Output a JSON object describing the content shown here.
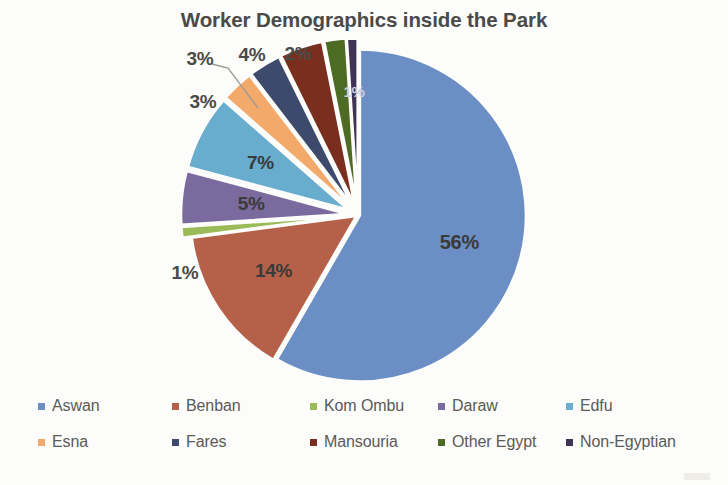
{
  "chart_data": {
    "type": "pie",
    "title": "Worker Demographics inside the Park",
    "xlabel": "",
    "ylabel": "",
    "legend_position": "bottom",
    "grid": false,
    "value_suffix": "%",
    "categories": [
      "Aswan",
      "Benban",
      "Kom Ombu",
      "Daraw",
      "Edfu",
      "Esna",
      "Fares",
      "Mansouria",
      "Other Egypt",
      "Non-Egyptian"
    ],
    "values": [
      56,
      14,
      1,
      5,
      7,
      3,
      3,
      4,
      2,
      1
    ],
    "labels": [
      "56%",
      "14%",
      "1%",
      "5%",
      "7%",
      "3%",
      "3%",
      "4%",
      "2%",
      "1%"
    ],
    "colors": [
      "#6b8fc4",
      "#b5614a",
      "#9bbb59",
      "#7a6a9e",
      "#68acce",
      "#f3a96a",
      "#3d4a6b",
      "#7a2f1e",
      "#4e6b23",
      "#413355"
    ],
    "slices": [
      {
        "name": "Aswan",
        "value": 56,
        "label": "56%",
        "color": "#6b8fc4"
      },
      {
        "name": "Benban",
        "value": 14,
        "label": "14%",
        "color": "#b5614a"
      },
      {
        "name": "Kom Ombu",
        "value": 1,
        "label": "1%",
        "color": "#9bbb59"
      },
      {
        "name": "Daraw",
        "value": 5,
        "label": "5%",
        "color": "#7a6a9e"
      },
      {
        "name": "Edfu",
        "value": 7,
        "label": "7%",
        "color": "#68acce"
      },
      {
        "name": "Esna",
        "value": 3,
        "label": "3%",
        "color": "#f3a96a"
      },
      {
        "name": "Fares",
        "value": 3,
        "label": "3%",
        "color": "#3d4a6b"
      },
      {
        "name": "Mansouria",
        "value": 4,
        "label": "4%",
        "color": "#7a2f1e"
      },
      {
        "name": "Other Egypt",
        "value": 2,
        "label": "2%",
        "color": "#4e6b23"
      },
      {
        "name": "Non-Egyptian",
        "value": 1,
        "label": "1%",
        "color": "#413355"
      }
    ]
  },
  "title": {
    "text": "Worker Demographics inside the Park"
  },
  "slice_labels": [
    {
      "text": "56%"
    },
    {
      "text": "14%"
    },
    {
      "text": "1%"
    },
    {
      "text": "5%"
    },
    {
      "text": "7%"
    },
    {
      "text": "3%"
    },
    {
      "text": "3%"
    },
    {
      "text": "4%"
    },
    {
      "text": "2%"
    },
    {
      "text": "1%"
    }
  ],
  "legend": {
    "rows": [
      [
        {
          "label": "Aswan",
          "color": "#6b8fc4"
        },
        {
          "label": "Benban",
          "color": "#b5614a"
        },
        {
          "label": "Kom Ombu",
          "color": "#9bbb59"
        },
        {
          "label": "Daraw",
          "color": "#7a6a9e"
        },
        {
          "label": "Edfu",
          "color": "#68acce"
        }
      ],
      [
        {
          "label": "Esna",
          "color": "#f3a96a"
        },
        {
          "label": "Fares",
          "color": "#3d4a6b"
        },
        {
          "label": "Mansouria",
          "color": "#7a2f1e"
        },
        {
          "label": "Other Egypt",
          "color": "#4e6b23"
        },
        {
          "label": "Non-Egyptian",
          "color": "#413355"
        }
      ]
    ]
  }
}
